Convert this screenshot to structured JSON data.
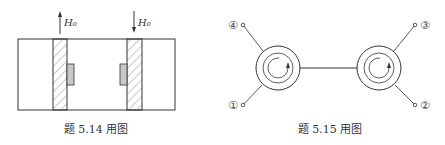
{
  "figures": [
    {
      "caption": "题 5.14 用图",
      "field_labels": [
        "H₀",
        "H₀"
      ],
      "field_directions": [
        "up",
        "down"
      ]
    },
    {
      "caption": "题 5.15 用图",
      "ports": [
        "④",
        "①",
        "③",
        "②"
      ]
    }
  ],
  "colors": {
    "line": "#333333",
    "hatch": "#777777",
    "ferrite_block": "#c8c8c8"
  }
}
